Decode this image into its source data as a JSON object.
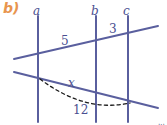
{
  "figure": {
    "part_label": "b)",
    "credit": "DAE",
    "colors": {
      "line": "#5a5f9e",
      "label": "#4a4f91",
      "part_label": "#e8954e",
      "dashed": "#1a1a1a",
      "background": "#ffffff"
    },
    "vertical_lines": [
      {
        "name": "a",
        "x": 38
      },
      {
        "name": "b",
        "x": 96
      },
      {
        "name": "c",
        "x": 128
      }
    ],
    "transversals": [
      {
        "id": "upper-transversal",
        "x1": 14,
        "y1": 59,
        "x2": 158,
        "y2": 26
      },
      {
        "id": "lower-transversal",
        "x1": 14,
        "y1": 72,
        "x2": 158,
        "y2": 108
      }
    ],
    "dashed_curve": {
      "id": "arc-12",
      "start_x": 40,
      "start_y": 79,
      "ctrl_x": 85,
      "ctrl_y": 113,
      "end_x": 130,
      "end_y": 103
    },
    "measures": [
      {
        "id": "m-5",
        "text": "5",
        "italic": false
      },
      {
        "id": "m-3",
        "text": "3",
        "italic": false
      },
      {
        "id": "m-x",
        "text": "x",
        "italic": true
      },
      {
        "id": "m-12",
        "text": "12",
        "italic": false
      }
    ]
  }
}
